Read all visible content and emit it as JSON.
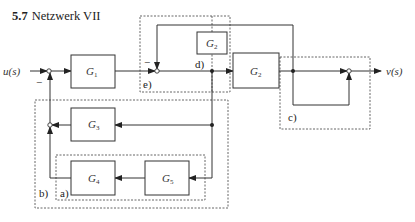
{
  "title": {
    "number": "5.7",
    "text": "Netzwerk VII"
  },
  "signals": {
    "input": "u(s)",
    "output": "v(s)"
  },
  "blocks": [
    {
      "id": "G1",
      "label": "G",
      "sub": "1"
    },
    {
      "id": "G2_small",
      "label": "G",
      "sub": "2"
    },
    {
      "id": "G2",
      "label": "G",
      "sub": "2"
    },
    {
      "id": "G3",
      "label": "G",
      "sub": "3"
    },
    {
      "id": "G4",
      "label": "G",
      "sub": "4"
    },
    {
      "id": "G5",
      "label": "G",
      "sub": "5"
    }
  ],
  "signs": {
    "minus_main": "−",
    "minus_inner": "−"
  },
  "regions": {
    "a": "a)",
    "b": "b)",
    "c": "c)",
    "d": "d)",
    "e": "e)"
  },
  "colors": {
    "line": "#333333",
    "dashed": "#555555"
  }
}
